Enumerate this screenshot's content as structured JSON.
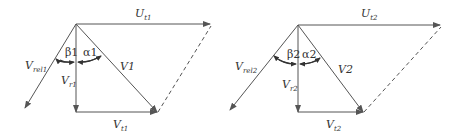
{
  "diagrams": [
    {
      "name": "velocity-triangle-1",
      "labels": {
        "U": "U",
        "U_sub": "t1",
        "Vrel": "V",
        "Vrel_sub": "rel1",
        "Vr": "V",
        "Vr_sub": "r1",
        "V": "V1",
        "Vt": "V",
        "Vt_sub": "t1",
        "beta": "β1",
        "alpha": "α1"
      }
    },
    {
      "name": "velocity-triangle-2",
      "labels": {
        "U": "U",
        "U_sub": "t2",
        "Vrel": "V",
        "Vrel_sub": "rel2",
        "Vr": "V",
        "Vr_sub": "r2",
        "V": "V2",
        "Vt": "V",
        "Vt_sub": "t2",
        "beta": "β2",
        "alpha": "α2"
      }
    }
  ],
  "colors": {
    "line": "#555555",
    "text": "#333333",
    "background": "#ffffff"
  }
}
